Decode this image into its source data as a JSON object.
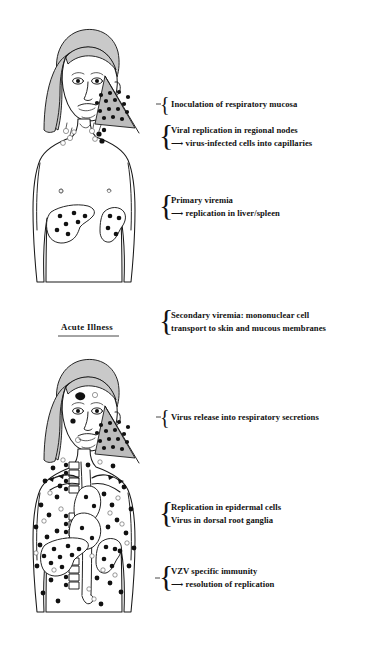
{
  "figure": {
    "colors": {
      "ink": "#111111",
      "hair_gray": "#c9c9c9",
      "wedge_gray": "#bdbdbd",
      "lesion_black": "#111111",
      "background": "#ffffff"
    }
  },
  "panels": [
    {
      "id": "incubation",
      "section_label": "",
      "annotations": [
        {
          "id": "inoculation",
          "brace": "single",
          "lines": [
            "Inoculation of respiratory mucosa"
          ]
        },
        {
          "id": "regional-nodes",
          "brace": "double",
          "lines": [
            "Viral replication in regional nodes",
            "⟶ virus-infected cells into capillaries"
          ],
          "line2_arrow": true,
          "line2_text": "virus-infected cells into capillaries"
        },
        {
          "id": "primary-viremia",
          "brace": "double",
          "lines": [
            "Primary viremia",
            "⟶ replication in liver/spleen"
          ],
          "line2_arrow": true,
          "line2_text": "replication in liver/spleen"
        }
      ],
      "figure_parts": [
        "head-with-gray-hair",
        "respiratory-inoculation-wedge",
        "cervical-lymph-node-chain",
        "torso-upper-body",
        "liver-with-lesions",
        "spleen-with-lesions"
      ]
    },
    {
      "id": "acute-illness",
      "section_label": "Acute Illness",
      "annotations": [
        {
          "id": "secondary-viremia",
          "brace": "double",
          "lines": [
            "Secondary viremia: mononuclear cell",
            "transport to skin and mucous membranes"
          ]
        },
        {
          "id": "virus-release",
          "brace": "single",
          "lines": [
            "Virus release into respiratory secretions"
          ]
        },
        {
          "id": "epidermal-ganglia",
          "brace": "double",
          "lines": [
            "Replication in epidermal cells",
            "Virus in dorsal root ganglia"
          ]
        },
        {
          "id": "vzv-immunity",
          "brace": "double",
          "lines": [
            "VZV specific immunity",
            "⟶ resolution of replication"
          ],
          "line2_arrow": true,
          "line2_text": "resolution of replication"
        }
      ],
      "figure_parts": [
        "head-with-gray-hair-and-skin-lesions",
        "respiratory-release-wedge",
        "torso-with-disseminated-skin-lesions",
        "spine-with-dorsal-root-ganglia",
        "heart-and-great-vessels",
        "liver-with-lesions",
        "spleen-with-lesions"
      ]
    }
  ]
}
